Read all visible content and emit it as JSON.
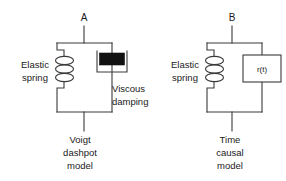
{
  "figure": {
    "background_color": "#ffffff",
    "line_color": "#3a3a3a",
    "fill_color": "#111111",
    "text_color": "#1a1a1a"
  },
  "panels": [
    {
      "id": "voigt",
      "node_label": "A",
      "spring_label_line1": "Elastic",
      "spring_label_line2": "spring",
      "element_label_line1": "Viscous",
      "element_label_line2": "damping",
      "caption_line1": "Voigt",
      "caption_line2": "dashpot",
      "caption_line3": "model",
      "element_type": "dashpot",
      "element_text": ""
    },
    {
      "id": "time-causal",
      "node_label": "B",
      "spring_label_line1": "Elastic",
      "spring_label_line2": "spring",
      "element_label_line1": "",
      "element_label_line2": "",
      "caption_line1": "Time",
      "caption_line2": "causal",
      "caption_line3": "model",
      "element_type": "box",
      "element_text": "r(t)"
    }
  ]
}
